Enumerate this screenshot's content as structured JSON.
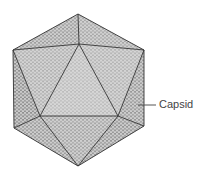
{
  "diagram": {
    "type": "icosahedral-virus-capsid",
    "label": "Capsid",
    "colors": {
      "face_light": "#b8b8b8",
      "face_mid": "#a6a6a6",
      "face_dark": "#8f8f8f",
      "edge": "#333333",
      "subunit": "#e0e0e0",
      "label_text": "#444444",
      "leader_line": "#555555"
    }
  }
}
